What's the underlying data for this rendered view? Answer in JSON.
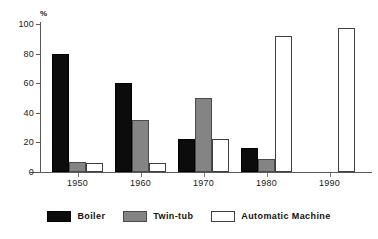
{
  "chart_data": {
    "type": "bar",
    "title": "",
    "subtitle": "",
    "xlabel": "",
    "ylabel": "%",
    "ylim": [
      0,
      100
    ],
    "ytick_labels": [
      "0",
      "20",
      "40",
      "60",
      "80",
      "100"
    ],
    "ytick_values": [
      0,
      20,
      40,
      60,
      80,
      100
    ],
    "grid": false,
    "legend_position": "bottom",
    "categories": [
      "1950",
      "1960",
      "1970",
      "1980",
      "1990"
    ],
    "series": [
      {
        "name": "Boiler",
        "color": "#0c0c0c",
        "values": [
          80,
          60,
          22,
          16,
          0
        ]
      },
      {
        "name": "Twin-tub",
        "color": "#848484",
        "values": [
          7,
          35,
          50,
          9,
          0
        ]
      },
      {
        "name": "Automatic Machine",
        "color": "#ffffff",
        "values": [
          6,
          6,
          22,
          92,
          97
        ]
      }
    ]
  },
  "axis": {
    "unit_label": "%"
  },
  "legend": {
    "items": [
      {
        "label": "Boiler",
        "swatch": "boiler-swatch"
      },
      {
        "label": "Twin-tub",
        "swatch": "twin-tub-swatch"
      },
      {
        "label": "Automatic Machine",
        "swatch": "automatic-machine-swatch"
      }
    ]
  }
}
